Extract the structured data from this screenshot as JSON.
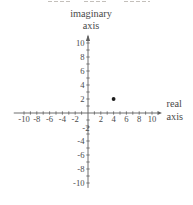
{
  "chart_data": {
    "type": "scatter",
    "title": "",
    "x_axis_title_lines": [
      "real",
      "axis"
    ],
    "y_axis_title_lines": [
      "imaginary",
      "axis"
    ],
    "x_range": [
      -11,
      11
    ],
    "y_range": [
      -11,
      11
    ],
    "tick_interval": 1,
    "label_interval": 2,
    "grid": false,
    "x_tick_labels": [
      "-10",
      "-8",
      "-6",
      "-4",
      "-2",
      "2",
      "4",
      "6",
      "8",
      "10"
    ],
    "y_tick_labels": [
      "10",
      "8",
      "6",
      "4",
      "2",
      "-2",
      "-4",
      "-6",
      "-8",
      "-10"
    ],
    "points": [
      {
        "x": 4,
        "y": 2
      }
    ]
  },
  "colors": {
    "ink": "#4a4a4a",
    "axis": "#5f5f5f",
    "point": "#1c1c1c",
    "artifact": "#c4c0bb",
    "background": "#ffffff"
  }
}
